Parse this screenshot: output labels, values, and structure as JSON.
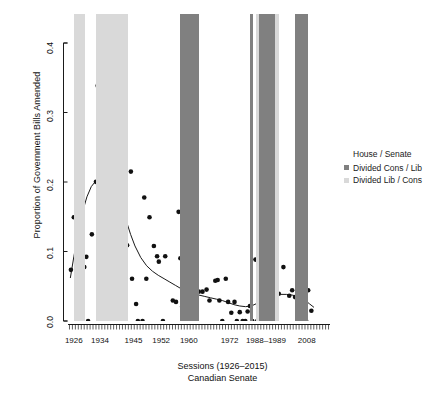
{
  "chart_data": {
    "type": "scatter",
    "title": "",
    "xlabel": "Sessions (1926–2015)",
    "xlabel_line2": "Canadian Senate",
    "ylabel": "Proportion of Government Bills Amended",
    "ylim": [
      0.0,
      0.45
    ],
    "xlim": [
      0,
      90
    ],
    "grid": false,
    "y_ticks": [
      "0.0",
      "0.1",
      "0.2",
      "0.3",
      "0.4"
    ],
    "y_tick_values": [
      0.0,
      0.1,
      0.2,
      0.3,
      0.4
    ],
    "x_ticks": [
      "1926",
      "1934",
      "1945",
      "1952",
      "1960",
      "1972",
      "1988–1989",
      "2008"
    ],
    "x_tick_positions": [
      2.0,
      11.0,
      22.5,
      32.0,
      41.5,
      55.5,
      68.0,
      82.0
    ],
    "n_minor_ticks": 89,
    "legend": {
      "position": "right",
      "title": "House / Senate",
      "entries": [
        {
          "label": "Divided Cons / Lib",
          "color": "#808080"
        },
        {
          "label": "Divided Lib / Cons",
          "color": "#d9d9d9"
        }
      ]
    },
    "bands": [
      {
        "label": "Divided Lib / Cons",
        "color": "#d9d9d9",
        "x0": 2.0,
        "x1": 6.0
      },
      {
        "label": "Divided Lib / Cons",
        "color": "#d9d9d9",
        "x0": 9.5,
        "x1": 20.5
      },
      {
        "label": "Divided Cons / Lib",
        "color": "#808080",
        "x0": 38.5,
        "x1": 45.0
      },
      {
        "label": "Divided Cons / Lib",
        "color": "#808080",
        "x0": 62.5,
        "x1": 63.5
      },
      {
        "label": "Divided Lib / Cons",
        "color": "#d9d9d9",
        "x0": 64.5,
        "x1": 65.5
      },
      {
        "label": "Divided Cons / Lib",
        "color": "#808080",
        "x0": 65.5,
        "x1": 71.0
      },
      {
        "label": "Divided Lib / Cons",
        "color": "#d9d9d9",
        "x0": 71.0,
        "x1": 72.5
      },
      {
        "label": "Divided Cons / Lib",
        "color": "#808080",
        "x0": 78.0,
        "x1": 82.5
      }
    ],
    "points": [
      {
        "x": 1.0,
        "y": 0.075
      },
      {
        "x": 2.0,
        "y": 0.152
      },
      {
        "x": 3.0,
        "y": 0.134
      },
      {
        "x": 3.6,
        "y": 0.061
      },
      {
        "x": 5.0,
        "y": 0.17
      },
      {
        "x": 5.6,
        "y": 0.079
      },
      {
        "x": 6.3,
        "y": 0.094
      },
      {
        "x": 6.9,
        "y": 0.0
      },
      {
        "x": 8.2,
        "y": 0.127
      },
      {
        "x": 9.6,
        "y": 0.204
      },
      {
        "x": 10.2,
        "y": 0.345
      },
      {
        "x": 10.6,
        "y": 0.388
      },
      {
        "x": 11.6,
        "y": 0.226
      },
      {
        "x": 12.3,
        "y": 0.246
      },
      {
        "x": 13.0,
        "y": 0.32
      },
      {
        "x": 13.2,
        "y": 0.2
      },
      {
        "x": 14.2,
        "y": 0.058
      },
      {
        "x": 16.0,
        "y": 0.205
      },
      {
        "x": 16.6,
        "y": 0.182
      },
      {
        "x": 17.2,
        "y": 0.27
      },
      {
        "x": 17.9,
        "y": 0.194
      },
      {
        "x": 19.0,
        "y": 0.167
      },
      {
        "x": 20.3,
        "y": 0.111
      },
      {
        "x": 21.6,
        "y": 0.219
      },
      {
        "x": 22.0,
        "y": 0.062
      },
      {
        "x": 23.4,
        "y": 0.025
      },
      {
        "x": 24.0,
        "y": 0.0
      },
      {
        "x": 25.6,
        "y": 0.0
      },
      {
        "x": 26.2,
        "y": 0.181
      },
      {
        "x": 26.9,
        "y": 0.062
      },
      {
        "x": 28.0,
        "y": 0.152
      },
      {
        "x": 29.5,
        "y": 0.11
      },
      {
        "x": 30.6,
        "y": 0.095
      },
      {
        "x": 31.2,
        "y": 0.087
      },
      {
        "x": 32.6,
        "y": 0.0
      },
      {
        "x": 33.4,
        "y": 0.095
      },
      {
        "x": 36.0,
        "y": 0.03
      },
      {
        "x": 37.1,
        "y": 0.028
      },
      {
        "x": 38.0,
        "y": 0.16
      },
      {
        "x": 38.6,
        "y": 0.092
      },
      {
        "x": 39.2,
        "y": 0.021
      },
      {
        "x": 39.8,
        "y": 0.03
      },
      {
        "x": 40.5,
        "y": 0.028
      },
      {
        "x": 41.4,
        "y": 0.0
      },
      {
        "x": 42.2,
        "y": 0.029
      },
      {
        "x": 43.0,
        "y": 0.021
      },
      {
        "x": 43.9,
        "y": 0.0
      },
      {
        "x": 44.9,
        "y": 0.043
      },
      {
        "x": 46.2,
        "y": 0.043
      },
      {
        "x": 47.6,
        "y": 0.046
      },
      {
        "x": 48.6,
        "y": 0.03
      },
      {
        "x": 50.6,
        "y": 0.059
      },
      {
        "x": 51.4,
        "y": 0.06
      },
      {
        "x": 52.0,
        "y": 0.03
      },
      {
        "x": 53.0,
        "y": 0.0
      },
      {
        "x": 54.2,
        "y": 0.062
      },
      {
        "x": 55.0,
        "y": 0.028
      },
      {
        "x": 56.1,
        "y": 0.012
      },
      {
        "x": 57.2,
        "y": 0.028
      },
      {
        "x": 58.0,
        "y": 0.0
      },
      {
        "x": 59.0,
        "y": 0.013
      },
      {
        "x": 60.0,
        "y": 0.0
      },
      {
        "x": 60.9,
        "y": 0.0
      },
      {
        "x": 61.7,
        "y": 0.014
      },
      {
        "x": 62.5,
        "y": 0.022
      },
      {
        "x": 63.3,
        "y": 0.0
      },
      {
        "x": 64.4,
        "y": 0.09
      },
      {
        "x": 65.0,
        "y": 0.0
      },
      {
        "x": 66.0,
        "y": 0.013
      },
      {
        "x": 67.0,
        "y": 0.074
      },
      {
        "x": 67.9,
        "y": 0.04
      },
      {
        "x": 68.8,
        "y": 0.079
      },
      {
        "x": 69.4,
        "y": 0.079
      },
      {
        "x": 70.4,
        "y": 0.105
      },
      {
        "x": 71.5,
        "y": 0.028
      },
      {
        "x": 72.4,
        "y": 0.04
      },
      {
        "x": 74.0,
        "y": 0.079
      },
      {
        "x": 76.0,
        "y": 0.037
      },
      {
        "x": 77.0,
        "y": 0.045
      },
      {
        "x": 78.0,
        "y": 0.035
      },
      {
        "x": 79.6,
        "y": 0.0
      },
      {
        "x": 80.6,
        "y": 0.0
      },
      {
        "x": 81.8,
        "y": 0.0
      },
      {
        "x": 82.5,
        "y": 0.045
      },
      {
        "x": 83.6,
        "y": 0.015
      }
    ],
    "smooth_line": {
      "name": "loess trend",
      "color": "#1a1a1a",
      "x": [
        0.8,
        2.0,
        3.5,
        5.0,
        6.5,
        8.0,
        9.5,
        11.0,
        12.5,
        14.0,
        15.5,
        17.0,
        18.5,
        20.0,
        21.5,
        23.0,
        25.0,
        27.0,
        29.0,
        31.0,
        33.0,
        35.0,
        37.0,
        39.0,
        41.0,
        43.0,
        45.0,
        47.0,
        49.0,
        51.0,
        53.0,
        55.0,
        57.0,
        59.0,
        61.0,
        63.0,
        65.0,
        67.0,
        69.0,
        71.0,
        73.0,
        75.0,
        77.0,
        79.0,
        81.0,
        83.0,
        84.5
      ],
      "y": [
        0.063,
        0.094,
        0.13,
        0.16,
        0.182,
        0.197,
        0.205,
        0.208,
        0.207,
        0.203,
        0.196,
        0.185,
        0.168,
        0.147,
        0.127,
        0.11,
        0.093,
        0.081,
        0.073,
        0.067,
        0.062,
        0.057,
        0.052,
        0.047,
        0.043,
        0.04,
        0.038,
        0.036,
        0.034,
        0.032,
        0.03,
        0.027,
        0.024,
        0.022,
        0.021,
        0.022,
        0.026,
        0.032,
        0.037,
        0.039,
        0.039,
        0.039,
        0.038,
        0.036,
        0.032,
        0.025,
        0.02
      ]
    },
    "point_color": "#111111",
    "point_size": 2.3
  }
}
